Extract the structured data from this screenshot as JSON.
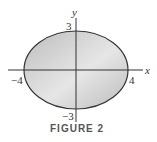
{
  "figure": {
    "caption": "FIGURE 2",
    "axes": {
      "x_label": "x",
      "y_label": "y"
    },
    "ticks": {
      "x_neg": "−4",
      "x_pos": "4",
      "y_pos": "3",
      "y_neg": "−3"
    },
    "ellipse": {
      "a": 4,
      "b": 3,
      "fill_color": "#c8c8c8",
      "stroke_color": "#333333"
    }
  }
}
